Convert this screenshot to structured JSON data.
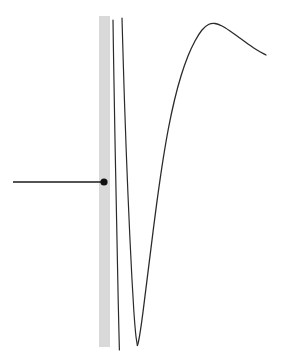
{
  "canvas": {
    "width": 286,
    "height": 362,
    "background": "#ffffff"
  },
  "chart_data": {
    "type": "line",
    "title": "",
    "subtitle": "",
    "xlabel": "",
    "ylabel": "",
    "grid": false,
    "legend": false,
    "axis_visible": false,
    "tick_labels": [],
    "annotations": [],
    "xlim": [
      0,
      286
    ],
    "ylim": [
      362,
      0
    ],
    "elements": {
      "band": {
        "name": "grey-vertical-band",
        "color": "#d9d9d9",
        "x": 99,
        "y": 16,
        "width": 11,
        "height": 331
      },
      "pointer": {
        "name": "pointer-line",
        "color": "#1a1a1a",
        "stroke_width": 1.6,
        "x_start": 13,
        "x_end": 104,
        "y": 182,
        "dot": {
          "cx": 104,
          "cy": 182,
          "r": 3.6,
          "color": "#111111"
        }
      }
    },
    "series": [
      {
        "name": "left-branch",
        "color": "#2b2b2b",
        "stroke_width": 1.2,
        "points": [
          [
            113.0,
            20.0
          ],
          [
            113.6,
            60.0
          ],
          [
            114.3,
            100.0
          ],
          [
            115.0,
            140.0
          ],
          [
            115.8,
            180.0
          ],
          [
            116.6,
            220.0
          ],
          [
            117.4,
            260.0
          ],
          [
            118.2,
            300.0
          ],
          [
            118.9,
            330.0
          ],
          [
            119.4,
            350.0
          ]
        ]
      },
      {
        "name": "right-branch-descending",
        "color": "#2b2b2b",
        "stroke_width": 1.2,
        "points": [
          [
            122.0,
            18.0
          ],
          [
            123.2,
            60.0
          ],
          [
            124.6,
            105.0
          ],
          [
            126.2,
            150.0
          ],
          [
            128.0,
            195.0
          ],
          [
            129.9,
            238.0
          ],
          [
            131.9,
            278.0
          ],
          [
            133.9,
            312.0
          ],
          [
            135.6,
            333.0
          ],
          [
            136.8,
            342.0
          ],
          [
            137.4,
            345.5
          ]
        ]
      },
      {
        "name": "main-curve",
        "color": "#2b2b2b",
        "stroke_width": 1.3,
        "points": [
          [
            137.4,
            345.5
          ],
          [
            138.6,
            341.0
          ],
          [
            140.5,
            330.0
          ],
          [
            143.0,
            312.0
          ],
          [
            146.0,
            288.0
          ],
          [
            149.5,
            260.0
          ],
          [
            153.5,
            228.0
          ],
          [
            158.0,
            194.0
          ],
          [
            163.0,
            160.0
          ],
          [
            168.5,
            128.0
          ],
          [
            174.5,
            100.0
          ],
          [
            181.0,
            76.0
          ],
          [
            188.0,
            56.0
          ],
          [
            195.0,
            41.0
          ],
          [
            202.0,
            30.0
          ],
          [
            208.5,
            24.5
          ],
          [
            215.0,
            23.5
          ],
          [
            222.0,
            26.0
          ],
          [
            230.0,
            31.0
          ],
          [
            239.0,
            37.5
          ],
          [
            248.0,
            44.0
          ],
          [
            257.0,
            50.0
          ],
          [
            266.0,
            55.0
          ]
        ]
      }
    ]
  }
}
